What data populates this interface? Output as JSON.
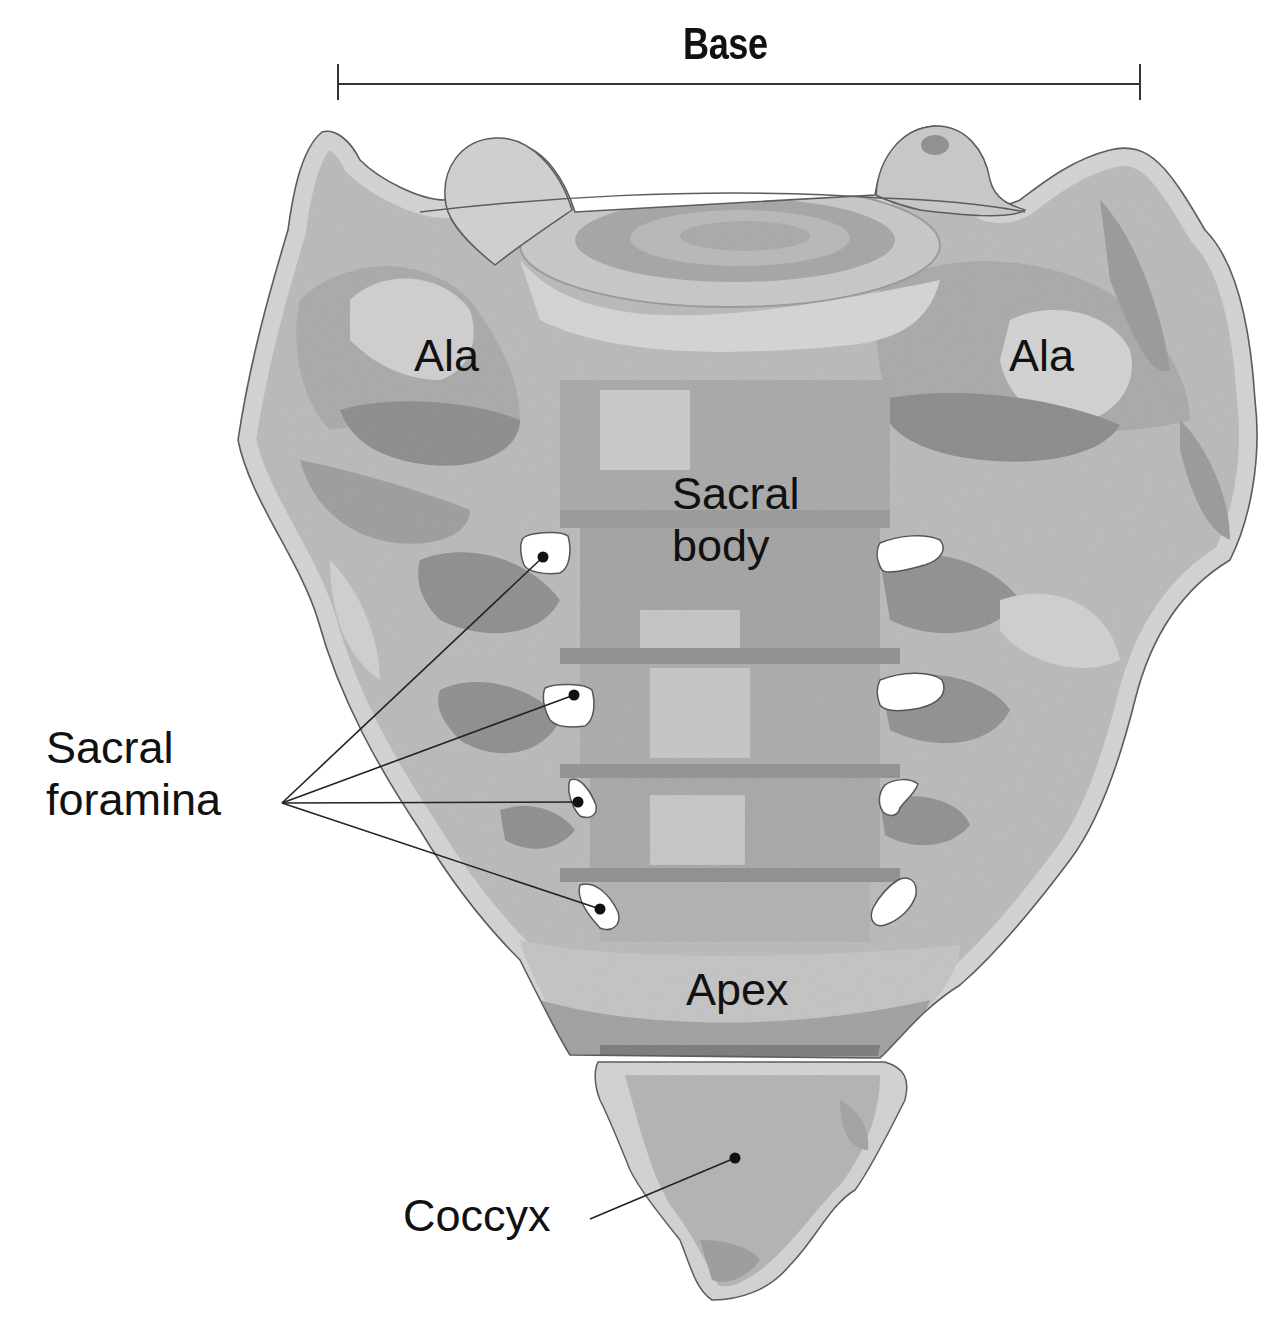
{
  "figure": {
    "colors": {
      "background": "#ffffff",
      "bone_base": "#b9b9b9",
      "bone_light": "#d6d6d6",
      "bone_mid": "#a3a3a3",
      "bone_dark": "#8a8a8a",
      "outline": "#555555",
      "foramen": "#ffffff",
      "text": "#111111",
      "leader_line": "#222222"
    }
  },
  "labels": {
    "base": "Base",
    "ala_left": "Ala",
    "ala_right": "Ala",
    "sacral_body_line1": "Sacral",
    "sacral_body_line2": "body",
    "sacral_foramina_line1": "Sacral",
    "sacral_foramina_line2": "foramina",
    "apex": "Apex",
    "coccyx": "Coccyx"
  },
  "base_dimension": {
    "x1": 338,
    "x2": 1140,
    "y": 84,
    "tick_top": 64,
    "tick_bottom": 100
  },
  "leaders": {
    "foramina_origin": {
      "x": 282,
      "y": 803
    },
    "foramina_targets": [
      {
        "x": 543,
        "y": 557
      },
      {
        "x": 574,
        "y": 695
      },
      {
        "x": 578,
        "y": 802
      },
      {
        "x": 600,
        "y": 909
      }
    ],
    "coccyx": {
      "from": {
        "x": 590,
        "y": 1219
      },
      "to": {
        "x": 735,
        "y": 1158
      }
    }
  }
}
